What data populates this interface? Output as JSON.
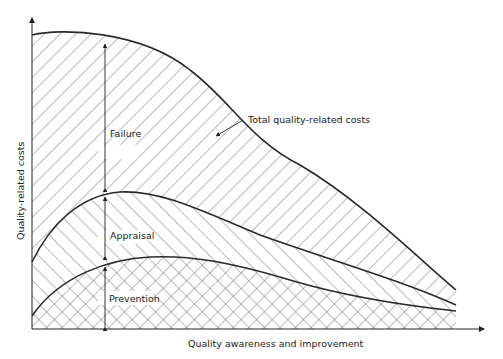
{
  "diagram": {
    "type": "stacked-area-concept",
    "x_axis_label": "Quality awareness and improvement",
    "y_axis_label": "Quality-related costs",
    "regions": [
      {
        "name": "prevention",
        "label": "Prevention",
        "pattern": "cross-hatch"
      },
      {
        "name": "appraisal",
        "label": "Appraisal",
        "pattern": "back-diagonal-hatch"
      },
      {
        "name": "failure",
        "label": "Failure",
        "pattern": "forward-diagonal-hatch"
      }
    ],
    "callout": "Total quality-related costs",
    "colors": {
      "line": "#2a2a2a",
      "hatch": "#555555",
      "background": "#ffffff"
    }
  }
}
